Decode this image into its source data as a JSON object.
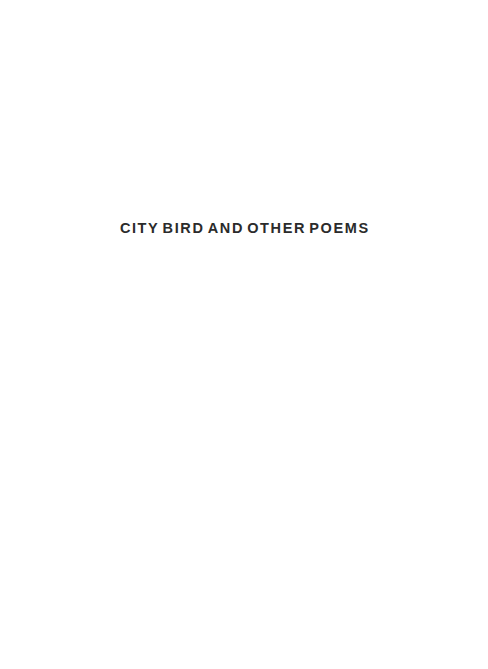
{
  "page": {
    "kind": "half-title-page",
    "background_color": "#ffffff",
    "width": 488,
    "height": 669
  },
  "title": {
    "text": "CITY BIRD AND OTHER POEMS",
    "words": [
      "CITY",
      "BIRD",
      "AND",
      "OTHER",
      "POEMS"
    ],
    "color": "#2b2b2b",
    "alignment": "center"
  }
}
